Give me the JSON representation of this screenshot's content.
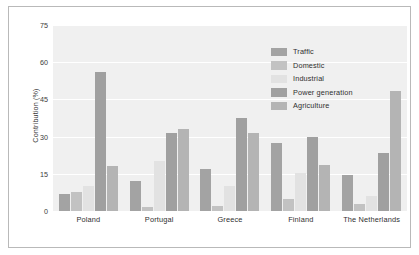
{
  "chart_data": {
    "type": "bar",
    "title": "",
    "xlabel": "",
    "ylabel": "Contribution (%)",
    "ylim": [
      0,
      75
    ],
    "yticks": [
      0,
      15,
      30,
      45,
      60,
      75
    ],
    "grid": true,
    "legend_position": "upper right",
    "categories": [
      "Poland",
      "Portugal",
      "Greece",
      "Finland",
      "The Netherlands"
    ],
    "series": [
      {
        "name": "Traffic",
        "color": "#a3a3a3",
        "values": [
          7,
          12,
          17,
          27.5,
          14.5
        ]
      },
      {
        "name": "Domestic",
        "color": "#c2c2c2",
        "values": [
          7.5,
          1.5,
          2,
          5,
          3
        ]
      },
      {
        "name": "Industrial",
        "color": "#e2e2e2",
        "values": [
          10,
          20,
          10,
          15.5,
          6
        ]
      },
      {
        "name": "Power generation",
        "color": "#a0a0a0",
        "values": [
          56,
          31.5,
          37.5,
          30,
          23.5
        ]
      },
      {
        "name": "Agriculture",
        "color": "#b4b4b4",
        "values": [
          18,
          33,
          31.5,
          18.5,
          48.5
        ]
      }
    ]
  },
  "style": {
    "plot_background": "#f0f0f0",
    "grid_color": "#ffffff",
    "frame_color": "#b9b9b9",
    "text_color": "#2f2f2f"
  }
}
